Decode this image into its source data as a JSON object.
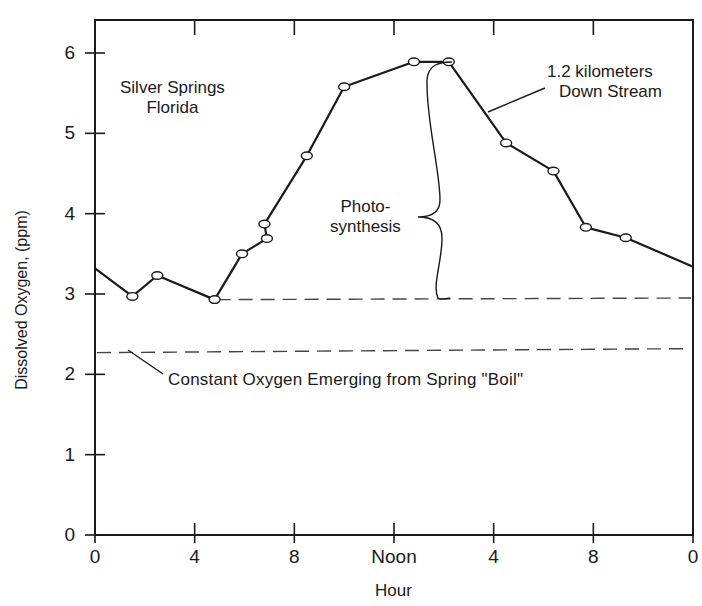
{
  "chart_data": {
    "type": "line",
    "title": "",
    "xlabel": "Hour",
    "ylabel": "Dissolved Oxygen, (ppm)",
    "xlim": [
      0,
      24
    ],
    "ylim": [
      0,
      6.4
    ],
    "x_ticks": [
      {
        "pos": 0,
        "label": "0"
      },
      {
        "pos": 4,
        "label": "4"
      },
      {
        "pos": 8,
        "label": "8"
      },
      {
        "pos": 12,
        "label": "Noon"
      },
      {
        "pos": 16,
        "label": "4"
      },
      {
        "pos": 20,
        "label": "8"
      },
      {
        "pos": 24,
        "label": "0"
      }
    ],
    "y_ticks": [
      {
        "pos": 0,
        "label": "0"
      },
      {
        "pos": 1,
        "label": "1"
      },
      {
        "pos": 2,
        "label": "2"
      },
      {
        "pos": 3,
        "label": "3"
      },
      {
        "pos": 4,
        "label": "4"
      },
      {
        "pos": 5,
        "label": "5"
      },
      {
        "pos": 6,
        "label": "6"
      }
    ],
    "grid": false,
    "series": [
      {
        "name": "1.2 kilometers Down Stream",
        "marker": "open-circle",
        "x": [
          0,
          1.5,
          2.5,
          4.8,
          5.9,
          6.9,
          6.8,
          8.5,
          10.0,
          12.8,
          14.2,
          16.5,
          18.4,
          19.7,
          21.3,
          24
        ],
        "y": [
          3.32,
          2.97,
          3.23,
          2.93,
          3.5,
          3.69,
          3.87,
          4.72,
          5.58,
          5.89,
          5.89,
          4.88,
          4.53,
          3.83,
          3.7,
          3.34
        ],
        "markers_at": [
          1,
          2,
          3,
          4,
          5,
          6,
          7,
          8,
          9,
          10,
          11,
          12,
          13,
          14
        ]
      },
      {
        "name": "Night baseline",
        "style": "dashed",
        "x": [
          4.8,
          24
        ],
        "y": [
          2.93,
          2.95
        ]
      },
      {
        "name": "Constant Oxygen Emerging from Spring \"Boil\"",
        "style": "dashed",
        "x": [
          0,
          24
        ],
        "y": [
          2.27,
          2.32
        ]
      }
    ],
    "annotations": [
      {
        "text": "Silver Springs",
        "line2": "Florida",
        "x": 2.3,
        "y": 5.4
      },
      {
        "text": "1.2  kilometers",
        "line2": "Down Stream",
        "x": 20.5,
        "y": 5.6
      },
      {
        "text": "Photo-",
        "line2": "synthesis",
        "x": 10.7,
        "y": 3.85
      },
      {
        "text": "Constant Oxygen Emerging from Spring \"Boil\"",
        "x": 3.0,
        "y": 2.0
      }
    ]
  },
  "labels": {
    "ylabel": "Dissolved Oxygen, (ppm)",
    "xlabel": "Hour",
    "site_line1": "Silver Springs",
    "site_line2": "Florida",
    "series_line1": "1.2  kilometers",
    "series_line2": "Down Stream",
    "photo_line1": "Photo-",
    "photo_line2": "synthesis",
    "boil": "Constant Oxygen Emerging from Spring \"Boil\""
  },
  "colors": {
    "ink": "#1a1a1a",
    "dash": "#444444",
    "background": "#ffffff"
  }
}
